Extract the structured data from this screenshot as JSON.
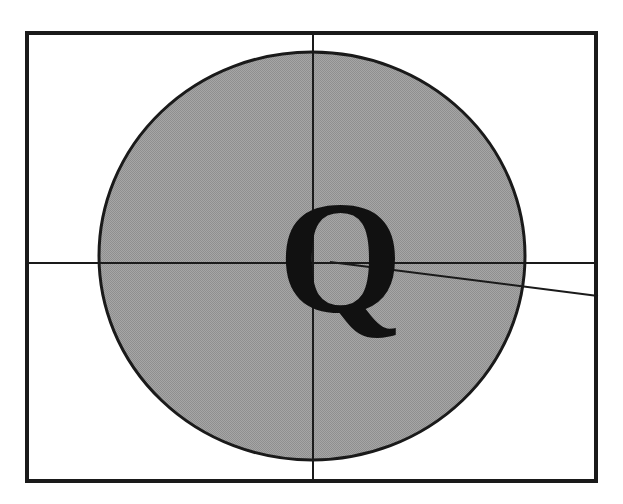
{
  "figure": {
    "background_color": "#ffffff",
    "frame": {
      "name": "outer-rectangle-frame",
      "x": 25,
      "y": 31,
      "width": 573,
      "height": 452,
      "stroke_color": "#1a1a1a",
      "stroke_width": 4,
      "fill": "none"
    },
    "ellipse": {
      "name": "shaded-ellipse",
      "cx": 312,
      "cy": 256,
      "rx": 213,
      "ry": 204,
      "fill_color": "#9c9c9c",
      "fill_description": "halftone dithered gray",
      "stroke_color": "#1a1a1a",
      "stroke_width": 3
    },
    "lines": [
      {
        "name": "vertical-axis-line",
        "orientation": "vertical",
        "x1": 313,
        "y1": 31,
        "x2": 313,
        "y2": 483,
        "stroke_color": "#1a1a1a",
        "stroke_width": 2
      },
      {
        "name": "horizontal-axis-line",
        "orientation": "horizontal",
        "x1": 25,
        "y1": 263,
        "x2": 598,
        "y2": 263,
        "stroke_color": "#1a1a1a",
        "stroke_width": 2
      },
      {
        "name": "diagonal-ray-line",
        "orientation": "diagonal",
        "x1": 330,
        "y1": 262,
        "x2": 598,
        "y2": 296,
        "stroke_color": "#1a1a1a",
        "stroke_width": 2
      }
    ],
    "label": {
      "name": "letter-q-label",
      "text": "Q",
      "x": 286,
      "y": 183,
      "font_size": 150,
      "font_weight": "bold",
      "color": "#111111"
    }
  }
}
